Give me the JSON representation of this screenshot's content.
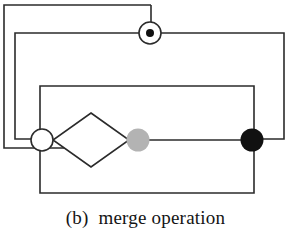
{
  "figure": {
    "caption": "(b)  merge operation",
    "caption_label": "(b)",
    "caption_text": "merge operation",
    "background_color": "#ffffff",
    "line_color": "#2b2b2b",
    "line_width": 1.6
  },
  "diagram": {
    "type": "petri-net-merge-operation",
    "colors": {
      "stroke": "#2b2b2b",
      "white_node_fill": "#ffffff",
      "gray_node_fill": "#b3b3b3",
      "black_node_fill": "#111111",
      "token_dot_fill": "#111111"
    },
    "nodes": [
      {
        "id": "place-top",
        "kind": "place-with-token",
        "label": "top place with token",
        "cx": 150,
        "cy": 33,
        "r": 11,
        "fill": "#ffffff",
        "token_r": 4,
        "token_fill": "#111111"
      },
      {
        "id": "place-left",
        "kind": "place",
        "label": "left merge place",
        "cx": 42,
        "cy": 140,
        "r": 11,
        "fill": "#ffffff"
      },
      {
        "id": "place-gray",
        "kind": "place-gray",
        "label": "gray place",
        "cx": 138,
        "cy": 140,
        "r": 11,
        "fill": "#b3b3b3"
      },
      {
        "id": "place-black",
        "kind": "place-black",
        "label": "black place",
        "cx": 252,
        "cy": 140,
        "r": 11,
        "fill": "#111111"
      },
      {
        "id": "transition-diamond",
        "kind": "diamond",
        "label": "merge transition diamond",
        "cx": 91,
        "cy": 140,
        "half_width": 38,
        "half_height": 27,
        "fill": "#ffffff"
      }
    ],
    "rectangles": [
      {
        "id": "outer-loop",
        "label": "outermost feedback loop",
        "left": 4,
        "top": 5,
        "right": 151,
        "bottom": 148
      },
      {
        "id": "middle-loop",
        "label": "middle feedback loop",
        "left": 15,
        "top": 33,
        "right": 284,
        "bottom": 139
      },
      {
        "id": "inner-loop",
        "label": "inner feedback loop",
        "left": 40,
        "top": 86,
        "right": 254,
        "bottom": 193
      }
    ],
    "connectors": [
      {
        "id": "left-to-diamond",
        "label": "edge from left place to diamond"
      },
      {
        "id": "diamond-to-gray",
        "label": "edge from diamond to gray place"
      },
      {
        "id": "gray-to-black",
        "label": "edge from gray place to black place"
      }
    ]
  }
}
